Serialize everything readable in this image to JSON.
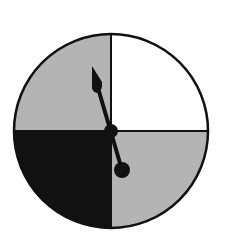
{
  "spinner": {
    "center": [
      111,
      131
    ],
    "radius": 97,
    "regions": [
      {
        "name": "top-right",
        "fill": "#ffffff"
      },
      {
        "name": "top-left",
        "fill": "#b4b4b4"
      },
      {
        "name": "bottom-left",
        "fill": "#111111"
      },
      {
        "name": "bottom-right",
        "fill": "#b4b4b4"
      }
    ],
    "outline_color": "#111111",
    "needle": {
      "tip": [
        92,
        67
      ],
      "tail": [
        122,
        170
      ],
      "color": "#111111"
    }
  }
}
